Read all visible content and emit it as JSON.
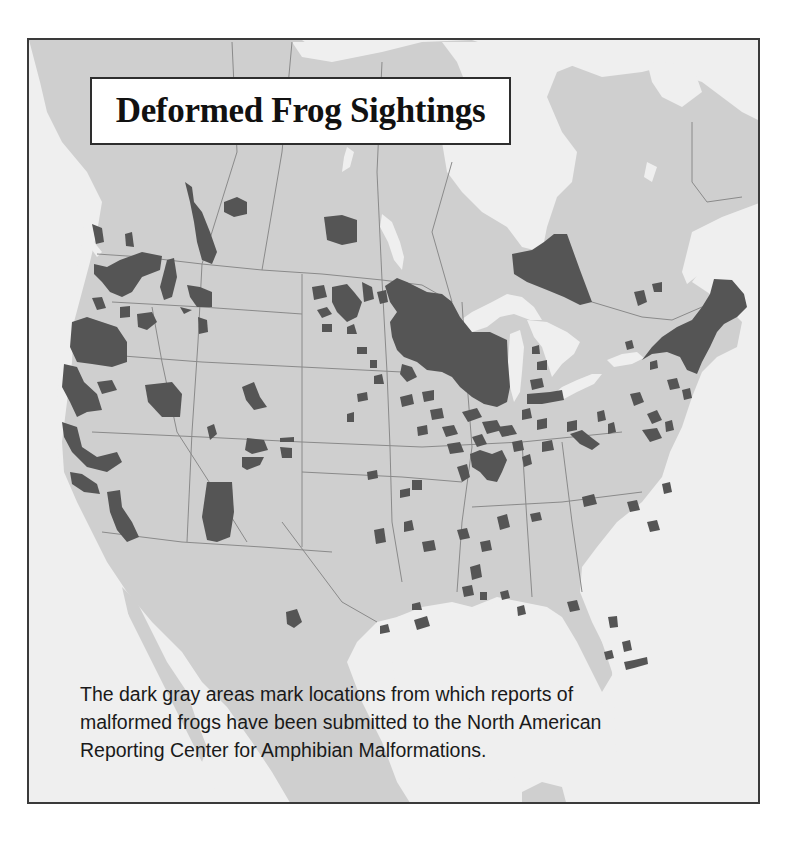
{
  "title": "Deformed Frog Sightings",
  "caption": {
    "lines": [
      "The dark gray areas mark locations from which reports of",
      "malformed frogs have been submitted to the North American",
      "Reporting Center for Amphibian Malformations."
    ]
  },
  "cutoff_text": "",
  "colors": {
    "water": "#efefef",
    "land": "#cfcfcf",
    "sighting": "#555555",
    "border_line": "#8a8a8a",
    "frame": "#3a3a3a"
  },
  "map": {
    "region": "North America (Canada, United States, northern Mexico)",
    "legend_meaning": "dark gray = locations with reported malformed frogs",
    "notable_clusters": [
      "Pacific Northwest (Washington, Oregon, northern California)",
      "British Columbia / Alberta border",
      "Northwestern Ontario / Quebec (large patch)",
      "Minnesota and Wisconsin (dense region)",
      "New England (Vermont, New Hampshire, Maine)",
      "Missouri / Illinois",
      "Scattered Midwest, South, and Florida sites"
    ]
  }
}
